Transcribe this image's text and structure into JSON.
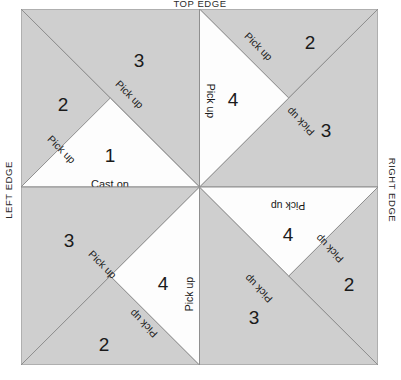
{
  "diagram": {
    "colors": {
      "gray_section": "#cfcfcf",
      "white_section": "#fdfdfd",
      "outline": "#8f8f8f",
      "text": "#1a1a1a",
      "background": "#ffffff"
    },
    "edges": {
      "top": "TOP EDGE",
      "left": "LEFT EDGE",
      "right": "RIGHT EDGE"
    },
    "labels": {
      "cast_on": "Cast on",
      "pick_up": "Pick up"
    },
    "quadrants": [
      {
        "name": "top-left",
        "sections": [
          {
            "number": "1",
            "shade": "white",
            "instruction": "Cast on"
          },
          {
            "number": "2",
            "shade": "gray",
            "instruction": "Pick up"
          },
          {
            "number": "3",
            "shade": "gray",
            "instruction": "Pick up"
          }
        ]
      },
      {
        "name": "top-right",
        "sections": [
          {
            "number": "4",
            "shade": "white",
            "instruction": "Pick up"
          },
          {
            "number": "2",
            "shade": "gray",
            "instruction": "Pick up"
          },
          {
            "number": "3",
            "shade": "gray",
            "instruction": "Pick up"
          }
        ]
      },
      {
        "name": "bottom-left",
        "sections": [
          {
            "number": "4",
            "shade": "white",
            "instruction": "Pick up"
          },
          {
            "number": "2",
            "shade": "gray",
            "instruction": "Pick up"
          },
          {
            "number": "3",
            "shade": "gray",
            "instruction": "Pick up"
          }
        ]
      },
      {
        "name": "bottom-right",
        "sections": [
          {
            "number": "4",
            "shade": "white",
            "instruction": "Pick up"
          },
          {
            "number": "2",
            "shade": "gray",
            "instruction": "Pick up"
          },
          {
            "number": "3",
            "shade": "gray",
            "instruction": "Pick up"
          }
        ]
      }
    ]
  }
}
